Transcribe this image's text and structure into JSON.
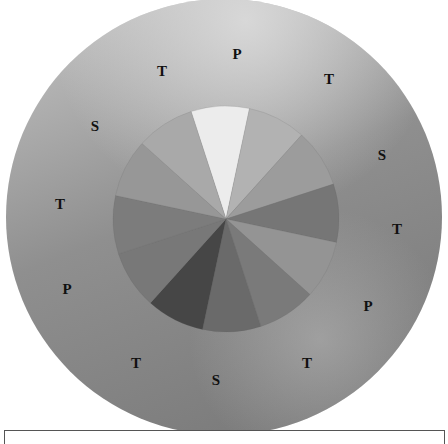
{
  "diagram": {
    "type": "color-wheel",
    "outer_disc": {
      "cx": 224,
      "cy": 217,
      "r": 218,
      "highlight_color": "#d4d4d4",
      "base_color": "#8e8e8e",
      "shadow_color": "#6f6f6f"
    },
    "inner_wheel": {
      "cx": 226,
      "cy": 219,
      "r": 113,
      "start_angle_deg": -18,
      "segments": [
        {
          "index": 1,
          "fill": "#ececec"
        },
        {
          "index": 2,
          "fill": "#b2b2b2"
        },
        {
          "index": 3,
          "fill": "#9c9c9c"
        },
        {
          "index": 4,
          "fill": "#767676"
        },
        {
          "index": 5,
          "fill": "#949494"
        },
        {
          "index": 6,
          "fill": "#7a7a7a"
        },
        {
          "index": 7,
          "fill": "#6a6a6a"
        },
        {
          "index": 8,
          "fill": "#464646"
        },
        {
          "index": 9,
          "fill": "#787878"
        },
        {
          "index": 10,
          "fill": "#7c7c7c"
        },
        {
          "index": 11,
          "fill": "#979797"
        },
        {
          "index": 12,
          "fill": "#a9a9a9"
        }
      ]
    },
    "labels": [
      {
        "text": "P",
        "x": 237,
        "y": 59
      },
      {
        "text": "T",
        "x": 329,
        "y": 84
      },
      {
        "text": "S",
        "x": 382,
        "y": 160
      },
      {
        "text": "T",
        "x": 397,
        "y": 234
      },
      {
        "text": "P",
        "x": 368,
        "y": 311
      },
      {
        "text": "T",
        "x": 307,
        "y": 368
      },
      {
        "text": "S",
        "x": 216,
        "y": 385
      },
      {
        "text": "T",
        "x": 136,
        "y": 368
      },
      {
        "text": "P",
        "x": 67,
        "y": 294
      },
      {
        "text": "T",
        "x": 60,
        "y": 209
      },
      {
        "text": "S",
        "x": 95,
        "y": 131
      },
      {
        "text": "T",
        "x": 162,
        "y": 76
      }
    ],
    "legend": {
      "P": "Primary",
      "S": "Secondary",
      "T": "Tertiary"
    }
  },
  "caption": {
    "text": ""
  }
}
